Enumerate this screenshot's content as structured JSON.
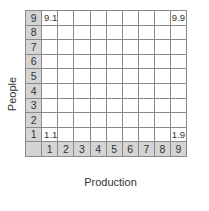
{
  "axes": {
    "y_label": "People",
    "x_label": "Production",
    "y_ticks": [
      "9",
      "8",
      "7",
      "6",
      "5",
      "4",
      "3",
      "2",
      "1"
    ],
    "x_ticks": [
      "1",
      "2",
      "3",
      "4",
      "5",
      "6",
      "7",
      "8",
      "9"
    ]
  },
  "cells": {
    "r9c1": "9.1",
    "r9c9": "9.9",
    "r1c1": "1.1",
    "r1c9": "1.9"
  },
  "colors": {
    "header_bg": "#d4d4d4",
    "grid_line": "#8a8a8a",
    "text": "#333333"
  }
}
